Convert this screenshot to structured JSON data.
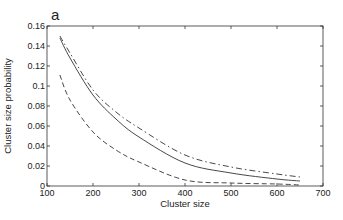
{
  "panel_label": "a",
  "chart_data": {
    "type": "line",
    "title": "",
    "panel": "a",
    "xlabel": "Cluster size",
    "ylabel": "Cluster size probability",
    "xlim": [
      100,
      700
    ],
    "ylim": [
      0,
      0.16
    ],
    "xticks": [
      100,
      200,
      300,
      400,
      500,
      600,
      700
    ],
    "yticks": [
      0,
      0.02,
      0.04,
      0.06,
      0.08,
      0.1,
      0.12,
      0.14,
      0.16
    ],
    "xtick_labels": [
      "100",
      "200",
      "300",
      "400",
      "500",
      "600",
      "700"
    ],
    "ytick_labels": [
      "0",
      "0.02",
      "0.04",
      "0.06",
      "0.08",
      "0.1",
      "0.12",
      "0.14",
      "0.16"
    ],
    "grid": false,
    "legend": null,
    "series": [
      {
        "name": "solid",
        "style": "solid",
        "x": [
          128,
          150,
          200,
          250,
          300,
          400,
          500,
          600,
          650
        ],
        "y": [
          0.148,
          0.128,
          0.091,
          0.067,
          0.049,
          0.023,
          0.013,
          0.007,
          0.005
        ]
      },
      {
        "name": "dash-dot",
        "style": "dashdot",
        "x": [
          128,
          150,
          200,
          250,
          300,
          400,
          500,
          600,
          650
        ],
        "y": [
          0.15,
          0.133,
          0.096,
          0.074,
          0.058,
          0.031,
          0.019,
          0.012,
          0.009
        ]
      },
      {
        "name": "dashed",
        "style": "dashed",
        "x": [
          128,
          150,
          200,
          250,
          300,
          400,
          500,
          600,
          650
        ],
        "y": [
          0.111,
          0.086,
          0.054,
          0.036,
          0.024,
          0.006,
          0.003,
          0.002,
          0.001
        ]
      }
    ]
  }
}
